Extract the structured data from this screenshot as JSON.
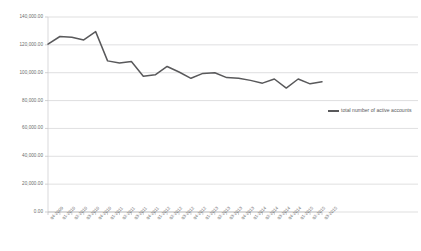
{
  "chart_data": {
    "type": "line",
    "title": "",
    "xlabel": "",
    "ylabel": "",
    "ylim": [
      0,
      140000
    ],
    "ytick_labels": [
      "140,000.00",
      "120,000.00",
      "100,000.00",
      "80,000.00",
      "60,000.00",
      "40,000.00",
      "20,000.00",
      "0.00"
    ],
    "ytick_values": [
      140000,
      120000,
      100000,
      80000,
      60000,
      40000,
      20000,
      0
    ],
    "grid": true,
    "legend_position": "right",
    "categories": [
      "q4-2009",
      "q1-2010",
      "q2-2010",
      "q3-2010",
      "q4-2010",
      "q1-2011",
      "q2-2011",
      "q3-2011",
      "q4-2011",
      "q1-2012",
      "q2-2012",
      "q3-2012",
      "q4-2012",
      "q1-2013",
      "q2-2013",
      "q3-2013",
      "q4-2013",
      "q1-2014",
      "q2-2014",
      "q3-2014",
      "q4-2014",
      "q1-2015",
      "q2-2015",
      "q3-2015"
    ],
    "series": [
      {
        "name": "total number of active accounts",
        "color": "#59595b",
        "values": [
          120500,
          126000,
          125500,
          123500,
          129500,
          108500,
          107000,
          108000,
          97500,
          98500,
          104500,
          100500,
          96000,
          99500,
          100000,
          96500,
          96000,
          94500,
          92500,
          95500,
          89000,
          95500,
          92000,
          93500
        ]
      }
    ]
  },
  "legend": {
    "label": "total number of active accounts"
  }
}
